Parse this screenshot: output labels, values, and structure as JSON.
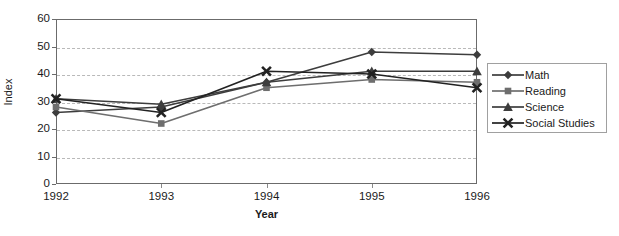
{
  "chart_data": {
    "type": "line",
    "title": "",
    "xlabel": "Year",
    "ylabel": "Index",
    "categories": [
      "1992",
      "1993",
      "1994",
      "1995",
      "1996"
    ],
    "ylim": [
      0,
      60
    ],
    "yticks": [
      0,
      10,
      20,
      30,
      40,
      50,
      60
    ],
    "grid": true,
    "legend_position": "right",
    "series": [
      {
        "name": "Math",
        "marker": "diamond",
        "color": "#3d3d3d",
        "values": [
          26,
          28,
          37,
          48,
          47
        ]
      },
      {
        "name": "Reading",
        "marker": "square",
        "color": "#6e6e6e",
        "values": [
          28,
          22,
          35,
          38,
          37
        ]
      },
      {
        "name": "Science",
        "marker": "triangle",
        "color": "#3d3d3d",
        "values": [
          31,
          29,
          37,
          41,
          41
        ]
      },
      {
        "name": "Social Studies",
        "marker": "cross-x",
        "color": "#222222",
        "values": [
          31,
          26,
          41,
          40,
          35
        ]
      }
    ]
  },
  "axes": {
    "y_title": "Index",
    "x_title": "Year",
    "y_tick_labels": [
      "60",
      "50",
      "40",
      "30",
      "20",
      "10",
      "0"
    ],
    "x_tick_labels": [
      "1992",
      "1993",
      "1994",
      "1995",
      "1996"
    ]
  },
  "legend": {
    "items": [
      {
        "label": "Math",
        "marker": "diamond-marker"
      },
      {
        "label": "Reading",
        "marker": "square-marker"
      },
      {
        "label": "Science",
        "marker": "triangle-marker"
      },
      {
        "label": "Social Studies",
        "marker": "x-marker"
      }
    ]
  },
  "colors": {
    "axis": "#6b6b6b",
    "grid": "#b9b9b9",
    "line_dark": "#3d3d3d",
    "line_gray": "#6e6e6e",
    "background": "#ffffff"
  }
}
